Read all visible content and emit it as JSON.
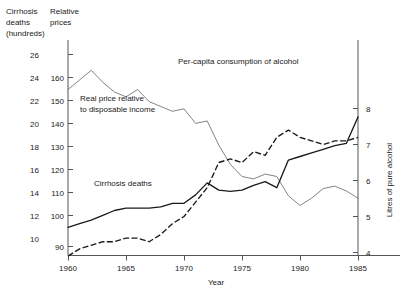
{
  "chart_data": {
    "type": "line",
    "title": "",
    "xlabel": "Year",
    "grid": false,
    "legend_position": "inline-annotations",
    "x": [
      1960,
      1961,
      1962,
      1963,
      1964,
      1965,
      1966,
      1967,
      1968,
      1969,
      1970,
      1971,
      1972,
      1973,
      1974,
      1975,
      1976,
      1977,
      1978,
      1979,
      1980,
      1981,
      1982,
      1983,
      1984,
      1985
    ],
    "xlim": [
      1960,
      1986
    ],
    "xticks": [
      1960,
      1965,
      1970,
      1975,
      1980,
      1985
    ],
    "xticklabels": [
      "1960",
      "1965",
      "1970",
      "1975",
      "1980",
      "1985"
    ],
    "axes": [
      {
        "id": "left-outer",
        "side": "left",
        "header": "Cirrhosis deaths (hundreds)",
        "header_lines": [
          "Cirrhosis",
          "deaths",
          "(hundreds)"
        ],
        "ticks": [
          10,
          12,
          14,
          16,
          18,
          20,
          22,
          24,
          26
        ],
        "lim": [
          9,
          27
        ]
      },
      {
        "id": "left-inner",
        "side": "left",
        "header": "Relative prices",
        "header_lines": [
          "Relative",
          "prices"
        ],
        "ticks": [
          90,
          100,
          110,
          120,
          130,
          140,
          150,
          160
        ],
        "lim": [
          88,
          172
        ]
      },
      {
        "id": "right",
        "side": "right",
        "header": "Litres of pure alcohol",
        "ticks": [
          4,
          5,
          6,
          7,
          8
        ],
        "lim": [
          3.6,
          8.6
        ]
      }
    ],
    "series": [
      {
        "name": "Cirrhosis deaths",
        "label": "Cirrhosis deaths",
        "style": "solid",
        "axis": "left-outer",
        "units": "hundreds",
        "values": [
          11.6,
          11.9,
          12.2,
          12.6,
          13.0,
          13.2,
          13.2,
          13.2,
          13.3,
          13.6,
          13.6,
          14.3,
          15.3,
          14.7,
          14.6,
          14.7,
          15.1,
          15.4,
          14.9,
          17.2,
          17.5,
          17.8,
          18.1,
          18.4,
          18.6,
          20.8
        ]
      },
      {
        "name": "Per-capita consumption of alcohol",
        "label": "Per-capita consumption of alcohol",
        "style": "dashed",
        "axis": "right",
        "units": "litres of pure alcohol",
        "values": [
          3.9,
          4.1,
          4.2,
          4.3,
          4.3,
          4.4,
          4.4,
          4.3,
          4.5,
          4.8,
          5.0,
          5.4,
          5.8,
          6.5,
          6.6,
          6.5,
          6.8,
          6.7,
          7.2,
          7.4,
          7.2,
          7.1,
          7.0,
          7.1,
          7.1,
          7.2
        ]
      },
      {
        "name": "Real price relative to disposable income",
        "label": "Real price relative to disposable income",
        "label_lines": [
          "Real price relative",
          "to disposable income"
        ],
        "style": "thin",
        "axis": "left-inner",
        "units": "index",
        "values": [
          155,
          159,
          163,
          158,
          154,
          152,
          155,
          150,
          148,
          146,
          147,
          141,
          142,
          132,
          124,
          119,
          118,
          120,
          119,
          111,
          107,
          110,
          114,
          115,
          113,
          110
        ]
      }
    ],
    "annotations": [
      {
        "text": "Per-capita consumption of alcohol",
        "x": 178,
        "y": 64
      },
      {
        "text": "Real price relative",
        "x": 80,
        "y": 101
      },
      {
        "text": "to disposable income",
        "x": 80,
        "y": 112
      },
      {
        "text": "Cirrhosis deaths",
        "x": 94,
        "y": 186
      }
    ]
  }
}
